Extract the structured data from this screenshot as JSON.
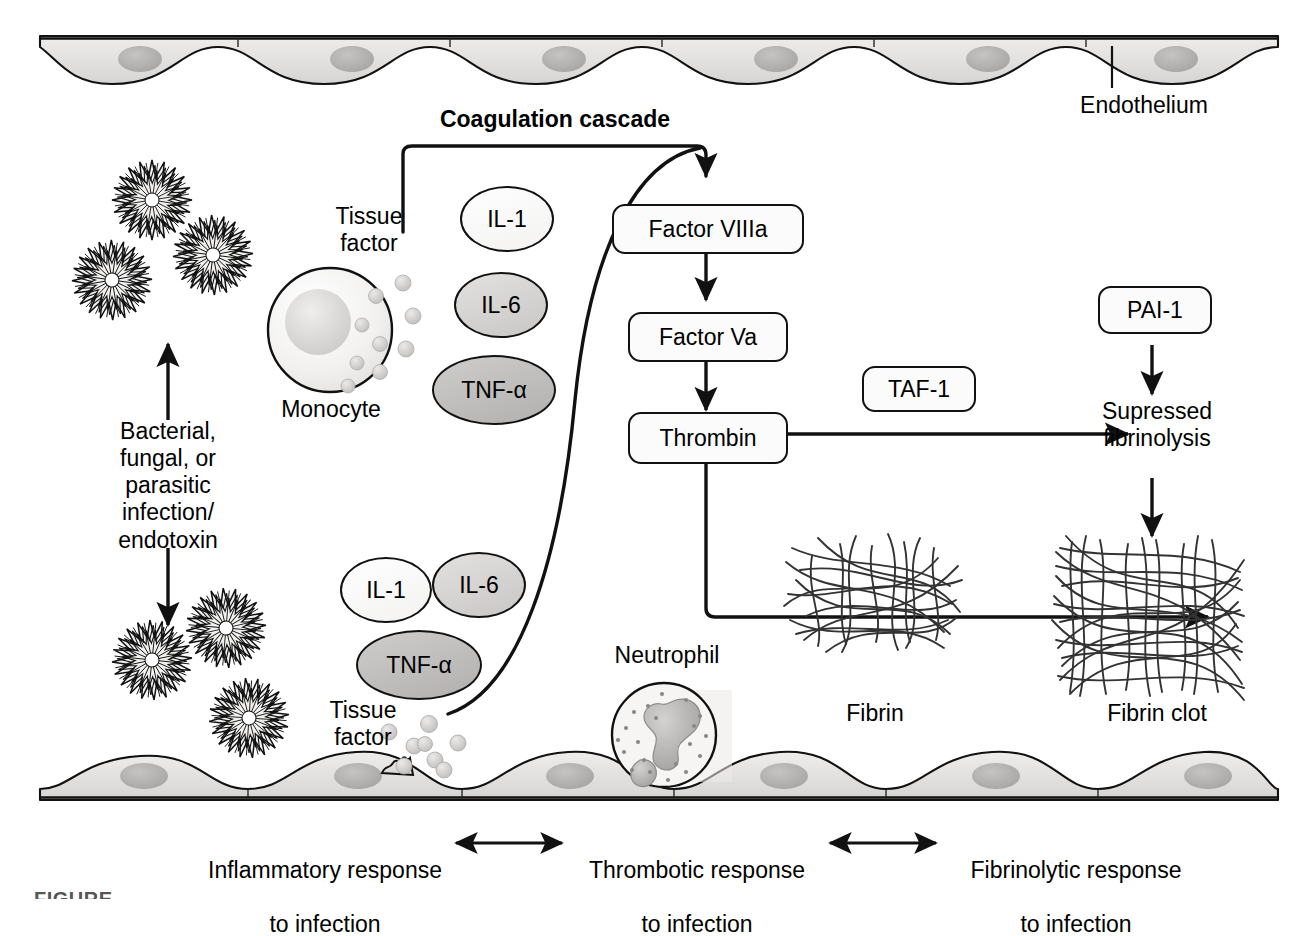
{
  "figure": {
    "caption_partial": "FIGURE"
  },
  "endothelium": {
    "label": "Endothelium",
    "top_band_name": "endothelium-top",
    "bottom_band_name": "endothelium-bottom",
    "cell_fill": "#e4e2e0",
    "nucleus_fill": "#b8b6b4"
  },
  "cascade": {
    "header": "Coagulation cascade",
    "steps": [
      {
        "id": "factor-viiia",
        "label": "Factor VIIIa"
      },
      {
        "id": "factor-va",
        "label": "Factor Va"
      },
      {
        "id": "thrombin",
        "label": "Thrombin"
      }
    ]
  },
  "infection": {
    "text": "Bacterial,\nfungal, or\nparasitic\ninfection/\nendotoxin",
    "pathogen_name": "pathogen-spiky-cluster",
    "pathogen_count_top": 3,
    "pathogen_count_bottom": 3
  },
  "cells": {
    "monocyte": {
      "label": "Monocyte",
      "fill": "#f0efee",
      "nucleus_fill": "#d8d6d4"
    },
    "neutrophil": {
      "label": "Neutrophil",
      "fill": "#f4f3f2",
      "lobe_fill": "#b5b3b1"
    }
  },
  "tissue_factor": {
    "upper_label": "Tissue\nfactor",
    "lower_label": "Tissue\nfactor",
    "granule_fill": "#cfcdcb"
  },
  "cytokines": {
    "upper_group": [
      {
        "label": "IL-1",
        "fill": "#fafafa",
        "shade": "light"
      },
      {
        "label": "IL-6",
        "fill": "#d3d1cf",
        "shade": "medium"
      },
      {
        "label": "TNF-α",
        "fill": "#bdbbb9",
        "shade": "dark"
      }
    ],
    "lower_group": [
      {
        "label": "IL-1",
        "fill": "#fafafa",
        "shade": "light"
      },
      {
        "label": "IL-6",
        "fill": "#d3d1cf",
        "shade": "medium"
      },
      {
        "label": "TNF-α",
        "fill": "#bdbbb9",
        "shade": "dark"
      }
    ]
  },
  "fibrinolysis": {
    "pai1_label": "PAI-1",
    "taf1_label": "TAF-1",
    "suppressed_label": "Supressed\nfibrinolysis"
  },
  "fibrin": {
    "mesh_label": "Fibrin",
    "clot_label": "Fibrin clot"
  },
  "footer": {
    "items": [
      {
        "line1": "Inflammatory response",
        "line2": "to infection"
      },
      {
        "line1": "Thrombotic response",
        "line2": "to infection"
      },
      {
        "line1": "Fibrinolytic response",
        "line2": "to infection"
      }
    ],
    "connector_icon": "double-headed-arrow"
  },
  "colors": {
    "stroke": "#111111",
    "background": "#ffffff",
    "cell_gray": "#e4e2e0",
    "nucleus_gray": "#b8b6b4"
  }
}
